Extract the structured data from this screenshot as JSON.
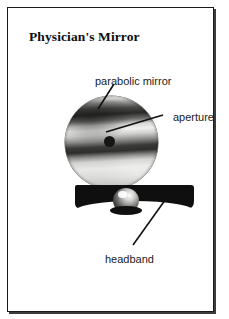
{
  "figure": {
    "title": "Physician's Mirror",
    "caption_labels": {
      "parabolic_mirror": "parabolic mirror",
      "aperture": "aperture",
      "headband": "headband"
    },
    "colors": {
      "frame_border": "#1a1a1a",
      "background": "#ffffff",
      "text": "#1a1a1a",
      "headband": "#0f0f0f",
      "aperture": "#161616"
    },
    "parts": [
      {
        "name": "parabolic mirror",
        "shape": "circle",
        "finish": "polished reflective banding"
      },
      {
        "name": "aperture",
        "shape": "circle",
        "finish": "dark central hole"
      },
      {
        "name": "headband",
        "shape": "band",
        "finish": "black strap"
      },
      {
        "name": "pivot",
        "shape": "ball joint",
        "finish": "chrome"
      }
    ]
  }
}
